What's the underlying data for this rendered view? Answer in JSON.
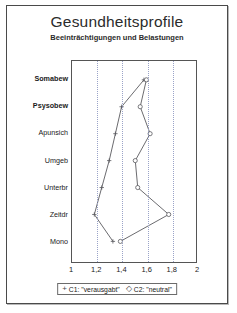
{
  "header": {
    "title": "Gesundheitsprofile",
    "subtitle": "Beeinträchtigungen und Belastungen"
  },
  "legend": {
    "entries": [
      {
        "glyph": "+",
        "label": "C1: \"verausgabt\""
      },
      {
        "glyph": "◇",
        "label": "C2: \"neutral\""
      }
    ]
  },
  "chart_data": {
    "type": "line",
    "orientation": "horizontal",
    "title": "Gesundheitsprofile",
    "subtitle": "Beeinträchtigungen und Belastungen",
    "xlabel": "",
    "ylabel": "",
    "xlim": [
      1,
      2
    ],
    "xticks": [
      1,
      1.2,
      1.4,
      1.6,
      1.8,
      2
    ],
    "xticklabels": [
      "1",
      "1,2",
      "1,4",
      "1,6",
      "1,8",
      "2"
    ],
    "grid": "vertical-dotted",
    "legend_position": "below-axis",
    "categories": [
      "Somabew",
      "Psysobew",
      "Apunsich",
      "Umgeb",
      "Unterbr",
      "Zeitdr",
      "Mono"
    ],
    "category_styles": [
      "bold",
      "bold",
      "normal",
      "normal",
      "normal",
      "normal",
      "normal"
    ],
    "series": [
      {
        "name": "C1: \"verausgabt\"",
        "marker": "+",
        "values": [
          1.58,
          1.4,
          1.35,
          1.3,
          1.24,
          1.18,
          1.33
        ]
      },
      {
        "name": "C2: \"neutral\"",
        "marker": "◇",
        "values": [
          1.6,
          1.55,
          1.63,
          1.51,
          1.53,
          1.78,
          1.39
        ]
      }
    ]
  }
}
